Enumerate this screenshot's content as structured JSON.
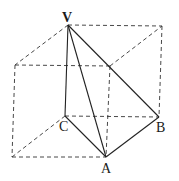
{
  "diagram": {
    "type": "3d-geometry",
    "labels": {
      "V": "V",
      "A": "A",
      "B": "B",
      "C": "C"
    },
    "points": {
      "V": [
        68,
        25
      ],
      "TR": [
        162,
        26
      ],
      "TL": [
        15,
        65
      ],
      "TF": [
        110,
        66
      ],
      "C": [
        65,
        116
      ],
      "B": [
        159,
        117
      ],
      "BL": [
        12,
        157
      ],
      "A": [
        106,
        157
      ]
    },
    "solid_edges": [
      [
        "V",
        "A"
      ],
      [
        "V",
        "B"
      ],
      [
        "V",
        "C"
      ],
      [
        "C",
        "A"
      ],
      [
        "A",
        "B"
      ]
    ],
    "dashed_edges": [
      [
        "V",
        "TR"
      ],
      [
        "V",
        "TL"
      ],
      [
        "TL",
        "TF"
      ],
      [
        "TF",
        "TR"
      ],
      [
        "TR",
        "B"
      ],
      [
        "TL",
        "BL"
      ],
      [
        "TF",
        "A"
      ],
      [
        "C",
        "B"
      ],
      [
        "C",
        "BL"
      ],
      [
        "BL",
        "A"
      ]
    ],
    "colors": {
      "line": "#222222",
      "background": "#ffffff"
    }
  }
}
